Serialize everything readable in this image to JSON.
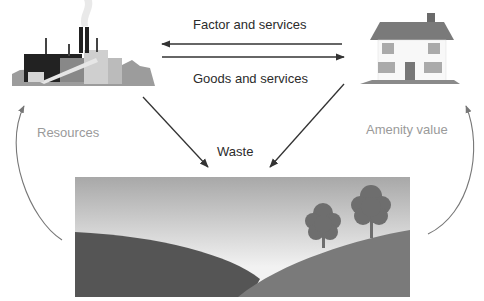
{
  "diagram": {
    "nodes": {
      "firms": {
        "label": "Factory (firms)",
        "icon": "factory-icon"
      },
      "households": {
        "label": "House (households)",
        "icon": "house-icon"
      },
      "environment": {
        "label": "Environment (landscape)",
        "icon": "landscape-icon"
      }
    },
    "flows": {
      "top": "Factor and services",
      "bottom": "Goods and services",
      "waste": "Waste",
      "resources": "Resources",
      "amenity": "Amenity value"
    },
    "colors": {
      "text_dark": "#2b2b2b",
      "text_light": "#9a9a9a",
      "arrow": "#333333",
      "curve": "#777777",
      "sky_top": "#a8a8a8",
      "sky_bottom": "#f2f2f2",
      "hill_left": "#555555",
      "hill_right": "#7a7a7a",
      "tree": "#6e6e6e"
    }
  }
}
